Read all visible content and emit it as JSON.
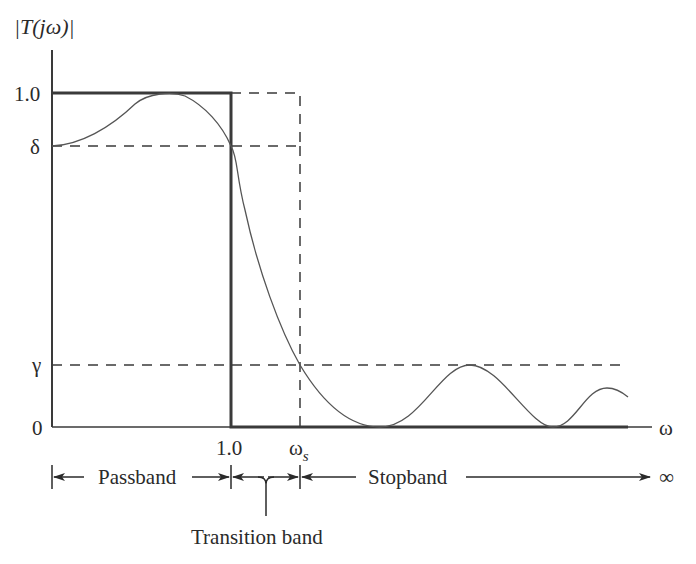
{
  "diagram": {
    "y_axis_label": "|T(jω)|",
    "x_axis_label": "ω",
    "y_ticks": [
      {
        "label": "1.0",
        "meaning": "passband maximum"
      },
      {
        "label": "δ",
        "meaning": "passband minimum"
      },
      {
        "label": "γ",
        "meaning": "stopband maximum"
      },
      {
        "label": "0",
        "meaning": "origin"
      }
    ],
    "x_ticks": [
      {
        "label": "1.0",
        "meaning": "passband edge"
      },
      {
        "label": "ω",
        "subscript": "s",
        "meaning": "stopband edge"
      }
    ],
    "bands": {
      "passband": "Passband",
      "stopband": "Stopband",
      "transition": "Transition band",
      "infinity": "∞"
    },
    "colors": {
      "ink": "#3a3a3a",
      "background": "#ffffff"
    }
  }
}
